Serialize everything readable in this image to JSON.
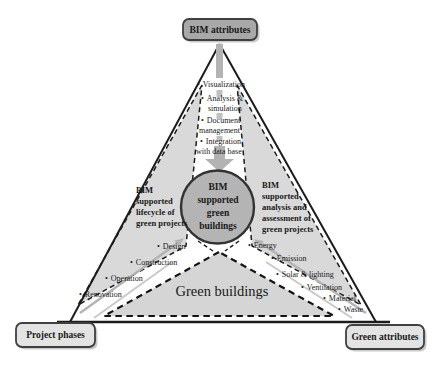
{
  "boxes": {
    "top": {
      "label": "BIM attributes"
    },
    "bottom_left": {
      "label": "Project phases"
    },
    "bottom_right": {
      "label": "Green attributes"
    }
  },
  "center_circle": {
    "lines": [
      "BIM",
      "supported",
      "green",
      "buildings"
    ]
  },
  "left_wedge": {
    "lines": [
      "BIM",
      "supported",
      "lifecycle of",
      "green projects"
    ]
  },
  "right_wedge": {
    "lines": [
      "BIM",
      "supported",
      "analysis and",
      "assessment of",
      "green projects"
    ]
  },
  "bottom_wedge": {
    "label": "Green buildings"
  },
  "bim_capabilities": [
    [
      "Visualization"
    ],
    [
      "Analysis &",
      "simulation"
    ],
    [
      "Document",
      "management"
    ],
    [
      "Integration",
      "with data base"
    ]
  ],
  "project_phases": [
    "Design",
    "Construction",
    "Operation",
    "Renovation"
  ],
  "green_attributes": [
    "Energy",
    "Emission",
    "Solar & lighting",
    "Ventilation",
    "Material",
    "Waste"
  ],
  "bullet": "•",
  "colors": {
    "top_box": "#a8a8a8",
    "corner_box": "#e3e3e3",
    "circle": "#b4b4b4",
    "wedge": "#d9d9d9",
    "bottom_wedge": "#d5d5d5",
    "arrow_gray": "#b3b3b3"
  }
}
